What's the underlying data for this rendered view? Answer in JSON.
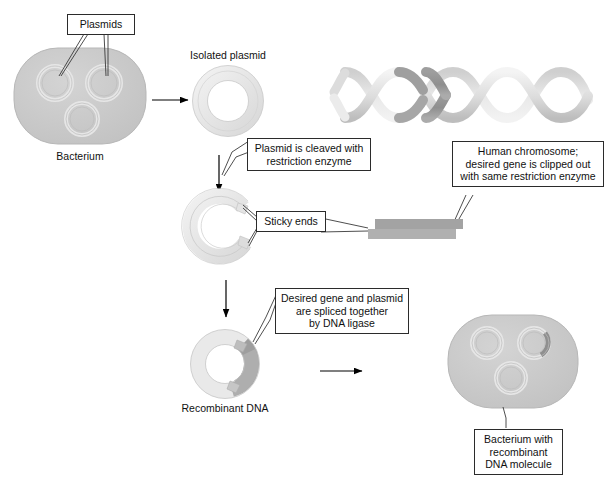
{
  "diagram": {
    "background_color": "#ffffff",
    "text_color": "#111111",
    "border_color": "#2b2b2b"
  },
  "callouts": {
    "plasmids": "Plasmids",
    "plasmid_cleaved": "Plasmid is cleaved with\nrestriction enzyme",
    "human_chromosome": "Human chromosome;\ndesired gene is clipped out\nwith same restriction enzyme",
    "sticky_ends": "Sticky ends",
    "desired_gene_spliced": "Desired gene and plasmid\nare spliced together\nby DNA ligase",
    "bacterium_recombinant": "Bacterium with\nrecombinant\nDNA molecule"
  },
  "labels": {
    "bacterium": "Bacterium",
    "isolated_plasmid": "Isolated plasmid",
    "recombinant_dna": "Recombinant DNA"
  },
  "shapes": {
    "bacterium_fill": "#c9c9c9",
    "bacterium_stroke": "#b5b5b5",
    "plasmid_ring_light": "#ededed",
    "plasmid_ring_mid": "#d8d8d8",
    "plasmid_ring_stroke": "#cfcfcf",
    "gene_dark": "#9a9a9a",
    "gene_mid": "#b0b0b0",
    "dna_helix_light": "#ececec",
    "dna_helix_mid": "#c4c4c4",
    "dna_helix_dark": "#9b9b9b",
    "fragment_bar": "#a3a3a3",
    "arrow_color": "#000000",
    "leader_color": "#3a3a3a"
  },
  "icon_names": {
    "bacterium": "bacterium-icon",
    "plasmid": "plasmid-ring-icon",
    "cleaved_plasmid": "cleaved-plasmid-icon",
    "dna_helix": "dna-double-helix-icon",
    "dna_fragment": "dna-fragment-bars-icon",
    "recombinant_plasmid": "recombinant-plasmid-icon",
    "arrow": "arrow-icon"
  }
}
